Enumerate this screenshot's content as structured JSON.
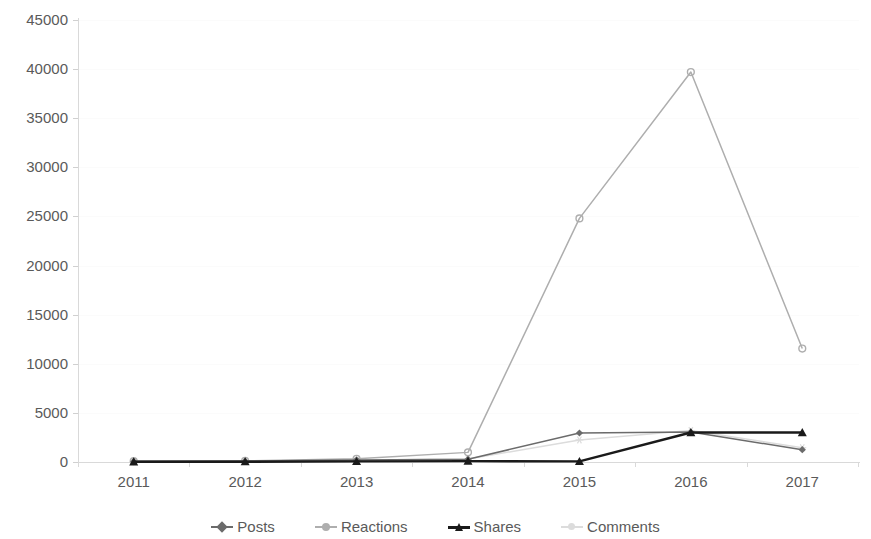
{
  "chart_data": {
    "type": "line",
    "title": "",
    "subtitle": "",
    "xlabel": "",
    "ylabel": "",
    "categories": [
      "2011",
      "2012",
      "2013",
      "2014",
      "2015",
      "2016",
      "2017"
    ],
    "x_tick_labels": [
      "2011",
      "2012",
      "2013",
      "2014",
      "2015",
      "2016",
      "2017"
    ],
    "y_tick_labels": [
      "0",
      "5000",
      "10000",
      "15000",
      "20000",
      "25000",
      "30000",
      "35000",
      "40000",
      "45000"
    ],
    "y_tick_values": [
      0,
      5000,
      10000,
      15000,
      20000,
      25000,
      30000,
      35000,
      40000,
      45000
    ],
    "ylim": [
      0,
      45000
    ],
    "grid": true,
    "legend_position": "bottom",
    "series": [
      {
        "name": "Posts",
        "color": "#6b6b6b",
        "marker": "diamond",
        "values": [
          60,
          90,
          210,
          280,
          2950,
          3050,
          1250
        ]
      },
      {
        "name": "Reactions",
        "color": "#aeaeae",
        "marker": "circle",
        "values": [
          90,
          120,
          330,
          980,
          24800,
          39700,
          11550
        ]
      },
      {
        "name": "Shares",
        "color": "#1a1a1a",
        "marker": "triangle",
        "values": [
          20,
          30,
          60,
          90,
          60,
          3000,
          3000
        ]
      },
      {
        "name": "Comments",
        "color": "#dcdcdc",
        "marker": "star",
        "values": [
          40,
          70,
          180,
          300,
          2250,
          3200,
          1450
        ]
      }
    ]
  },
  "legend": {
    "items": [
      {
        "label": "Posts"
      },
      {
        "label": "Reactions"
      },
      {
        "label": "Shares"
      },
      {
        "label": "Comments"
      }
    ]
  }
}
